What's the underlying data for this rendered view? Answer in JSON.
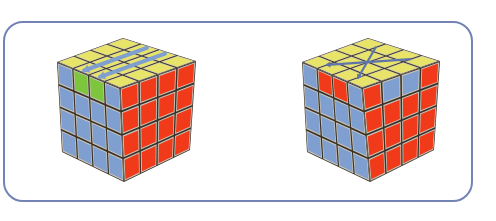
{
  "figure": {
    "frame_color": "#7384b4",
    "colors": {
      "Y": "#e8e46a",
      "B": "#7f9fd0",
      "R": "#f03a1a",
      "G": "#7cc53c",
      "gap": "#3a3228",
      "arrow": "#7f9fd0"
    },
    "cubes": [
      {
        "id": "left-cube",
        "vertices": {
          "top_back": [
            123,
            38
          ],
          "left": [
            57,
            62
          ],
          "right": [
            196,
            61
          ],
          "front_top": [
            120,
            88
          ],
          "bottom_left": [
            62,
            152
          ],
          "front_bottom": [
            124,
            182
          ],
          "bottom_right": [
            190,
            150
          ]
        },
        "top_face": [
          [
            "Y",
            "Y",
            "Y",
            "Y"
          ],
          [
            "Y",
            "Y",
            "Y",
            "Y"
          ],
          [
            "Y",
            "Y",
            "Y",
            "Y"
          ],
          [
            "Y",
            "Y",
            "Y",
            "Y"
          ]
        ],
        "left_face": [
          [
            "B",
            "G",
            "G",
            "B"
          ],
          [
            "B",
            "B",
            "B",
            "B"
          ],
          [
            "B",
            "B",
            "B",
            "B"
          ],
          [
            "B",
            "B",
            "B",
            "B"
          ]
        ],
        "right_face": [
          [
            "R",
            "R",
            "R",
            "R"
          ],
          [
            "R",
            "R",
            "R",
            "R"
          ],
          [
            "R",
            "R",
            "R",
            "R"
          ],
          [
            "R",
            "R",
            "R",
            "R"
          ]
        ],
        "arrows": [
          {
            "type": "double-left",
            "from": [
              0.05,
              1.5
            ],
            "to": [
              0.95,
              1.5
            ]
          },
          {
            "type": "double-left",
            "from": [
              0.05,
              2.5
            ],
            "to": [
              0.95,
              2.5
            ]
          }
        ]
      },
      {
        "id": "right-cube",
        "vertices": {
          "top_back": [
            368,
            38
          ],
          "left": [
            302,
            62
          ],
          "right": [
            440,
            61
          ],
          "front_top": [
            362,
            88
          ],
          "bottom_left": [
            307,
            152
          ],
          "front_bottom": [
            370,
            182
          ],
          "bottom_right": [
            434,
            150
          ]
        },
        "top_face": [
          [
            "Y",
            "Y",
            "Y",
            "Y"
          ],
          [
            "Y",
            "Y",
            "Y",
            "Y"
          ],
          [
            "Y",
            "Y",
            "Y",
            "Y"
          ],
          [
            "Y",
            "Y",
            "Y",
            "Y"
          ]
        ],
        "left_face": [
          [
            "B",
            "R",
            "R",
            "B"
          ],
          [
            "B",
            "B",
            "B",
            "B"
          ],
          [
            "B",
            "B",
            "B",
            "B"
          ],
          [
            "B",
            "B",
            "B",
            "B"
          ]
        ],
        "right_face": [
          [
            "R",
            "B",
            "B",
            "R"
          ],
          [
            "R",
            "R",
            "R",
            "R"
          ],
          [
            "R",
            "R",
            "R",
            "R"
          ],
          [
            "R",
            "R",
            "R",
            "R"
          ]
        ],
        "arrows": [
          {
            "type": "cross",
            "from": [
              0.15,
              1.0
            ],
            "to": [
              0.85,
              3.0
            ]
          },
          {
            "type": "cross",
            "from": [
              0.15,
              3.0
            ],
            "to": [
              0.85,
              1.0
            ]
          }
        ]
      }
    ]
  }
}
